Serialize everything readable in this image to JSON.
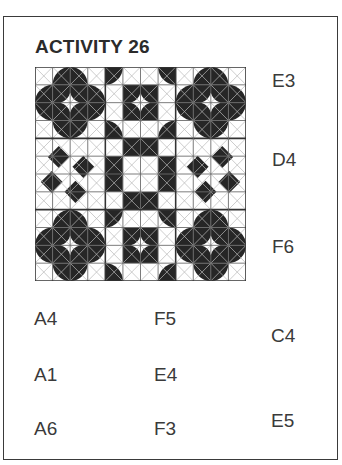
{
  "activity": {
    "title": "ACTIVITY 26"
  },
  "side_labels": [
    {
      "text": "E3"
    },
    {
      "text": "D4"
    },
    {
      "text": "F6"
    }
  ],
  "answer_options": {
    "column1": [
      "A4",
      "A1",
      "A6"
    ],
    "column2": [
      "F5",
      "E4",
      "F3"
    ],
    "column3": [
      "C4",
      "E5"
    ]
  },
  "pattern": {
    "grid_size": "12x12",
    "block_size": "4x4",
    "fill_color": "#262626",
    "line_color": "#9a9a9a"
  }
}
